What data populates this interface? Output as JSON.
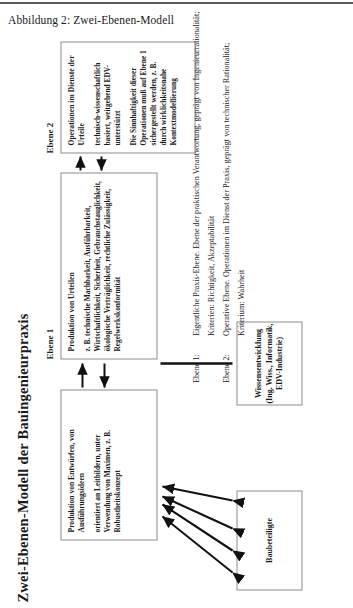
{
  "figure": {
    "caption": "Abbildung 2: Zwei-Ebenen-Modell",
    "vertical_title": "Zwei-Ebenen-Modell der Bauingenieurpraxis"
  },
  "levels": {
    "level1_label": "Ebene 1",
    "level2_label": "Ebene 2"
  },
  "boxes": {
    "urteile": {
      "heading": "Produktion von Urteilen",
      "body": "z. B. technische Machbarkeit, Ausführbarkeit, Wirtschaftlichkeit, Sicherheit, Gebrauchstauglichkeit, ökologische Verträglichkeit, rechtliche Zulässigkeit, Regelwerkskonformität"
    },
    "operationen": {
      "heading": "Operationen im Dienste der Urteile",
      "body": "technisch-wissenschaftlich basiert, weitgehend EDV-unterstützt",
      "note": "Die Sinnhaftigkeit dieser Operationen muß auf Ebene 1 sichergestellt werden, z. B. durch wirklichkeitsnahe Kontextmodellierung"
    },
    "entwuerfe": {
      "heading": "Produktion von Entwürfen, von Ausführungsideen",
      "body": "orientiert an Leitbildern, unter Verwendung von Maximen, z. B. Robustheitskonzept"
    },
    "baubeteiligte": {
      "label": "Baubeteiligte"
    },
    "wissensentwicklung": {
      "label": "Wissensentwicklung\n(Ing. Wiss., Informatik,\nEDV-Industrie)"
    }
  },
  "legend": [
    {
      "key": "Ebene 1:",
      "text": "Eigentliche Praxis-Ebene. Ebene der praktischen Verantwortung, geprägt von Ingenieurrationalität;"
    },
    {
      "key": "",
      "text": "Kriterien: Richtigkeit, Akzeptabilität"
    },
    {
      "key": "Ebene 2:",
      "text": "Operative Ebene. Operationen im Dienst der Praxis, geprägt von technischer Rationalität;"
    },
    {
      "key": "",
      "text": "Kriterium: Wahrheit"
    }
  ],
  "colors": {
    "border": "#8c8c8c",
    "ink": "#1a1a1a",
    "rule": "#5a5a5a"
  }
}
